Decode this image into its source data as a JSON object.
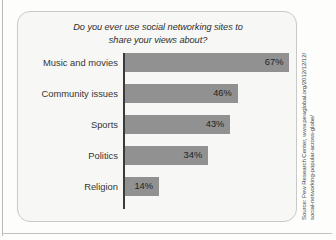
{
  "chart_data": {
    "type": "bar",
    "orientation": "horizontal",
    "title": "Do you ever use social networking sites to share your views about?",
    "title_line_1": "Do you ever use social networking sites to",
    "title_line_2": "share your views about?",
    "categories": [
      "Music and movies",
      "Community issues",
      "Sports",
      "Politics",
      "Religion"
    ],
    "values": [
      67,
      46,
      43,
      34,
      14
    ],
    "value_labels": [
      "67%",
      "46%",
      "43%",
      "34%",
      "14%"
    ],
    "label_position": [
      "inside",
      "inside",
      "inside",
      "inside",
      "inside"
    ],
    "xlabel": "",
    "ylabel": "",
    "xlim": [
      0,
      70
    ],
    "unit": "%",
    "grid": false,
    "legend": null,
    "bar_color": "#919191",
    "axis_color": "#3a3a3a",
    "background": "#f7f7f5",
    "px_per_percent": 2.46
  },
  "source": {
    "line_1": "Source: Pew Research Center, www.pewglobal.org/2012/12/12/",
    "line_2": "social-networking-popular-across-globe/"
  }
}
